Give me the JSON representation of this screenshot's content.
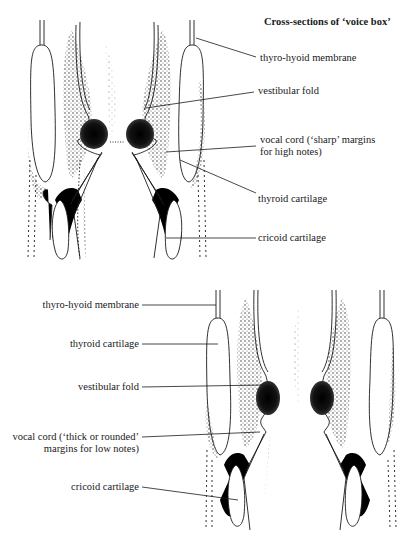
{
  "title": "Cross-sections of ‘voice box’",
  "top_diagram": {
    "caption": "High notes",
    "labels": [
      {
        "id": "thyro-hyoid-membrane",
        "text": "thyro-hyoid membrane"
      },
      {
        "id": "vestibular-fold",
        "text": "vestibular fold"
      },
      {
        "id": "vocal-cord",
        "line1": "vocal cord (‘sharp’ margins",
        "line2": "for high notes)"
      },
      {
        "id": "thyroid-cartilage",
        "text": "thyroid cartilage"
      },
      {
        "id": "cricoid-cartilage",
        "text": "cricoid cartilage"
      }
    ]
  },
  "bottom_diagram": {
    "caption": "Low notes",
    "labels": [
      {
        "id": "thyro-hyoid-membrane",
        "text": "thyro-hyoid membrane"
      },
      {
        "id": "thyroid-cartilage",
        "text": "thyroid cartilage"
      },
      {
        "id": "vestibular-fold",
        "text": "vestibular fold"
      },
      {
        "id": "vocal-cord",
        "line1": "vocal cord (‘thick or rounded’",
        "line2": "margins for low notes)"
      },
      {
        "id": "cricoid-cartilage",
        "text": "cricoid cartilage"
      }
    ]
  },
  "colors": {
    "ink": "#1a1a1a",
    "paper": "#ffffff",
    "stipple": "#333333"
  }
}
